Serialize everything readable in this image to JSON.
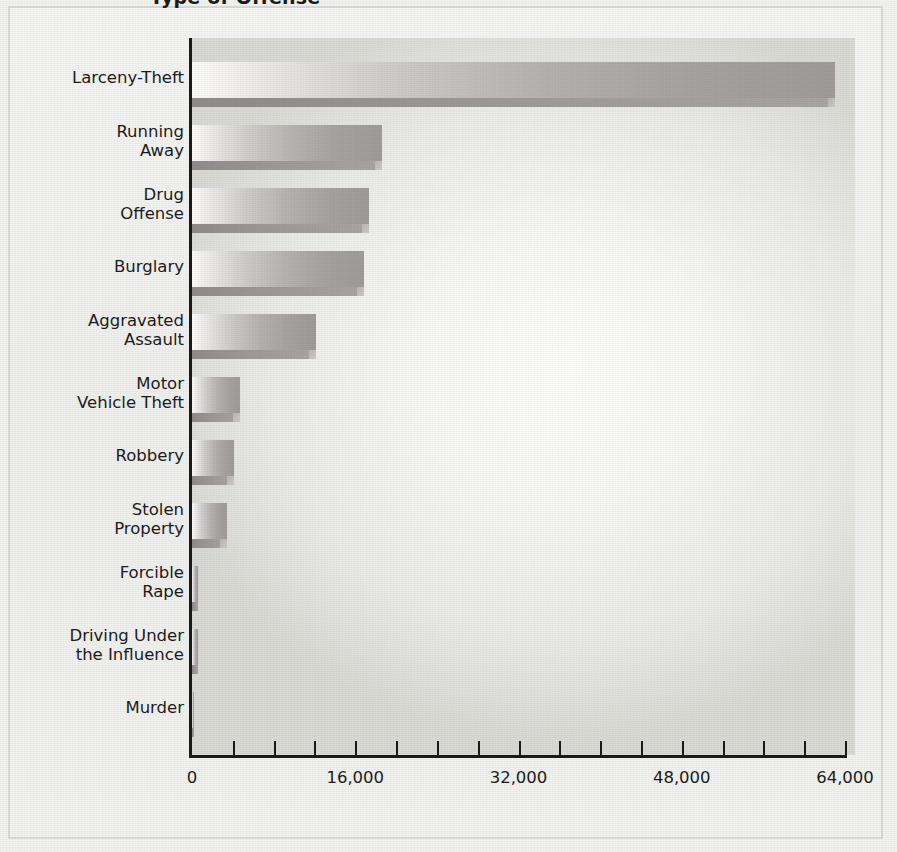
{
  "figure": {
    "title": "Type of Offense",
    "frame_color": "#d9d9d6",
    "bar_color": "#a8a5a2",
    "axis_color": "#1a1a1a"
  },
  "chart_data": {
    "type": "bar",
    "orientation": "horizontal",
    "title": "Type of Offense",
    "xlabel": "",
    "ylabel": "",
    "xlim": [
      0,
      64000
    ],
    "grid": false,
    "legend": false,
    "categories": [
      "Larceny-Theft",
      "Running Away",
      "Drug Offense",
      "Burglary",
      "Aggravated Assault",
      "Motor Vehicle Theft",
      "Robbery",
      "Stolen Property",
      "Forcible Rape",
      "Driving Under the Influence",
      "Murder"
    ],
    "category_labels_wrapped": [
      "Larceny-Theft",
      "Running\nAway",
      "Drug\nOffense",
      "Burglary",
      "Aggravated\nAssault",
      "Motor\nVehicle Theft",
      "Robbery",
      "Stolen\nProperty",
      "Forcible\nRape",
      "Driving Under\nthe Influence",
      "Murder"
    ],
    "values": [
      63000,
      18600,
      17300,
      16900,
      12200,
      4700,
      4100,
      3400,
      620,
      560,
      60
    ],
    "xticks": [
      0,
      4000,
      8000,
      12000,
      16000,
      20000,
      24000,
      28000,
      32000,
      36000,
      40000,
      44000,
      48000,
      52000,
      56000,
      60000,
      64000
    ],
    "xticklabels_major": [
      "0",
      "16,000",
      "32,000",
      "48,000",
      "64,000"
    ],
    "xtick_major_values": [
      0,
      16000,
      32000,
      48000,
      64000
    ]
  }
}
